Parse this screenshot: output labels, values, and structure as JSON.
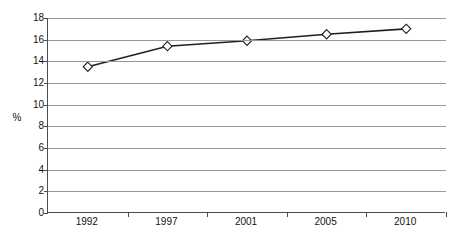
{
  "chart_data": {
    "type": "line",
    "title": "",
    "subtitle": "",
    "xlabel": "",
    "ylabel": "%",
    "categories": [
      "1992",
      "1997",
      "2001",
      "2005",
      "2010"
    ],
    "values": [
      13.5,
      15.4,
      15.9,
      16.5,
      17.0
    ],
    "series": [
      {
        "name": "",
        "values": [
          13.5,
          15.4,
          15.9,
          16.5,
          17.0
        ]
      }
    ],
    "ylim": [
      0,
      18
    ],
    "ytick_step": 2,
    "yticks": [
      18,
      16,
      14,
      12,
      10,
      8,
      6,
      4,
      2,
      0
    ],
    "ytick_labels": [
      "18",
      "16",
      "14",
      "12",
      "10",
      "8",
      "6",
      "4",
      "2",
      "0"
    ],
    "xtick_labels": [
      "1992",
      "1997",
      "2001",
      "2005",
      "2010"
    ],
    "grid": true,
    "grid_axis": "y",
    "legend": false,
    "legend_position": "none",
    "marker": "diamond",
    "marker_fill": "#ffffff",
    "line_color": "#231f20",
    "grid_color": "#999999",
    "axis_color": "#4d4d4d",
    "background": "#ffffff",
    "annotations": []
  }
}
